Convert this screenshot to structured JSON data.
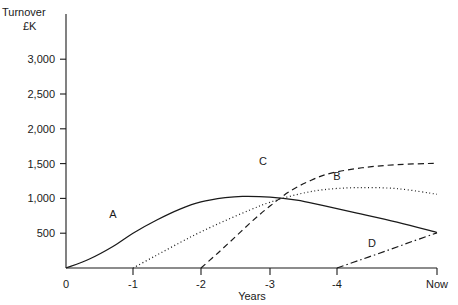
{
  "chart_data": {
    "type": "line",
    "title": "",
    "ylabel_line1": "Turnover",
    "ylabel_line2": "£K",
    "xlabel": "Years",
    "x_tick_labels": [
      "0",
      "-1",
      "-2",
      "-3",
      "-4",
      "Now"
    ],
    "x_tick_values": [
      0,
      -1,
      -2,
      -3,
      -4,
      -5
    ],
    "y_tick_labels": [
      "500",
      "1,000",
      "1,500",
      "2,000",
      "2,500",
      "3,000"
    ],
    "y_tick_values": [
      500,
      1000,
      1500,
      2000,
      2500,
      3000
    ],
    "ylim": [
      0,
      3250
    ],
    "xlim": [
      0,
      -5.2
    ],
    "grid": false,
    "legend": "inline-curve-labels",
    "axis_color": "#1a1a1a",
    "series": [
      {
        "name": "A",
        "label": "A",
        "style": "solid",
        "label_x": -0.7,
        "label_y": 720,
        "points": [
          [
            0,
            0
          ],
          [
            -0.35,
            130
          ],
          [
            -0.7,
            310
          ],
          [
            -1.0,
            500
          ],
          [
            -1.35,
            690
          ],
          [
            -1.7,
            850
          ],
          [
            -2.0,
            950
          ],
          [
            -2.35,
            1010
          ],
          [
            -2.6,
            1030
          ],
          [
            -3.0,
            1020
          ],
          [
            -3.4,
            975
          ],
          [
            -3.8,
            895
          ],
          [
            -4.2,
            790
          ],
          [
            -4.6,
            660
          ],
          [
            -5.0,
            510
          ]
        ]
      },
      {
        "name": "B",
        "label": "B",
        "style": "dotted",
        "label_x": -4.0,
        "label_y": 1265,
        "points": [
          [
            -1.0,
            0
          ],
          [
            -1.35,
            185
          ],
          [
            -1.7,
            370
          ],
          [
            -2.0,
            520
          ],
          [
            -2.35,
            680
          ],
          [
            -2.7,
            830
          ],
          [
            -3.0,
            945
          ],
          [
            -3.4,
            1055
          ],
          [
            -3.8,
            1125
          ],
          [
            -4.2,
            1155
          ],
          [
            -4.6,
            1140
          ],
          [
            -5.0,
            1060
          ]
        ]
      },
      {
        "name": "C",
        "label": "C",
        "style": "dashed",
        "label_x": -2.9,
        "label_y": 1480,
        "points": [
          [
            -2.0,
            0
          ],
          [
            -2.25,
            220
          ],
          [
            -2.5,
            450
          ],
          [
            -2.75,
            680
          ],
          [
            -3.0,
            890
          ],
          [
            -3.3,
            1105
          ],
          [
            -3.6,
            1255
          ],
          [
            -3.9,
            1360
          ],
          [
            -4.25,
            1440
          ],
          [
            -4.6,
            1485
          ],
          [
            -5.0,
            1505
          ]
        ]
      },
      {
        "name": "D",
        "label": "D",
        "style": "dashdot",
        "label_x": -4.35,
        "label_y": 295,
        "points": [
          [
            -4.0,
            0
          ],
          [
            -4.25,
            125
          ],
          [
            -4.5,
            250
          ],
          [
            -4.75,
            380
          ],
          [
            -5.0,
            505
          ]
        ]
      }
    ]
  }
}
